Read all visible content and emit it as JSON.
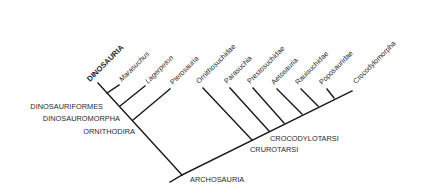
{
  "diagram": {
    "type": "cladogram",
    "line_color": "#1a1a1a",
    "text_color": "#2a2a2a",
    "taxa": [
      {
        "label": "DINOSAURIA",
        "style": "bold"
      },
      {
        "label": "Marasuchus",
        "style": "italic"
      },
      {
        "label": "Lagerpeton",
        "style": "italic"
      },
      {
        "label": "Pterosauria",
        "style": "normal"
      },
      {
        "label": "Ornithosuchidae",
        "style": "normal"
      },
      {
        "label": "Parasuchia",
        "style": "normal"
      },
      {
        "label": "Prestosuchidae",
        "style": "normal"
      },
      {
        "label": "Aetosauria",
        "style": "normal"
      },
      {
        "label": "Rauisuchidae",
        "style": "normal"
      },
      {
        "label": "Poposauridae",
        "style": "normal"
      },
      {
        "label": "Crocodylomorpha",
        "style": "normal"
      }
    ],
    "clades": {
      "dinosauriformes": "DINOSAURIFORMES",
      "dinosauromorpha": "DINOSAUROMORPHA",
      "ornithodira": "ORNITHODIRA",
      "archosauria": "ARCHOSAURIA",
      "crurotarsi": "CRUROTARSI",
      "crocodylotarsi": "CROCODYLOTARSI"
    }
  }
}
